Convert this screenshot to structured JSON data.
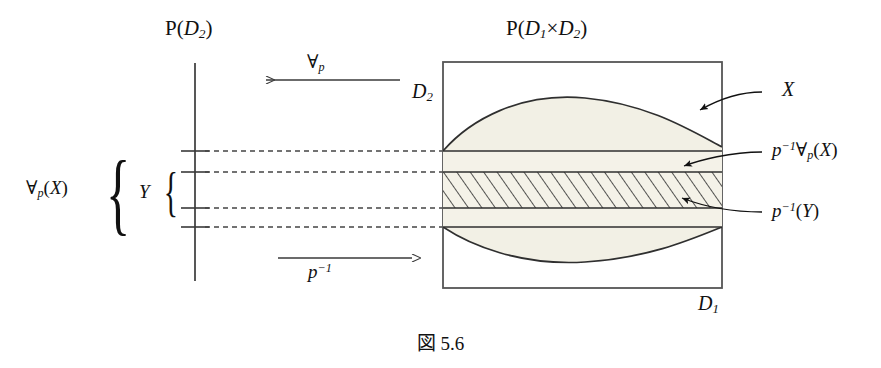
{
  "figure": {
    "caption": "図 5.6",
    "left_panel": {
      "title_prefix": "P",
      "title_open": "(",
      "title_base": "D",
      "title_sub": "2",
      "title_close": ")"
    },
    "right_panel": {
      "title_prefix": "P",
      "title_open": "(",
      "title_base1": "D",
      "title_sub1": "1",
      "title_times": "×",
      "title_base2": "D",
      "title_sub2": "2",
      "title_close": ")"
    },
    "axis_labels": {
      "vertical": "D",
      "vertical_sub": "2",
      "horizontal": "D",
      "horizontal_sub": "1"
    },
    "arrows": {
      "top": {
        "label_symbol": "∀",
        "label_sub": "p",
        "direction": "left"
      },
      "bottom": {
        "label_base": "p",
        "label_sup": "−1",
        "direction": "right"
      }
    },
    "left_labels": [
      {
        "name": "forall-p-X",
        "symbol": "∀",
        "sub": "p",
        "open": "(",
        "arg": "X",
        "close": ")"
      },
      {
        "name": "Y",
        "text": "Y"
      }
    ],
    "right_labels": [
      {
        "name": "X",
        "parts": [
          {
            "text": "X",
            "style": "italic"
          }
        ]
      },
      {
        "name": "p-inverse-forall-p-X",
        "parts": [
          {
            "text": "p",
            "style": "italic"
          },
          {
            "text": "−1",
            "style": "sup"
          },
          {
            "text": "∀",
            "style": "upright"
          },
          {
            "text": "p",
            "style": "sub"
          },
          {
            "text": "(",
            "style": "upright"
          },
          {
            "text": "X",
            "style": "italic"
          },
          {
            "text": ")",
            "style": "upright"
          }
        ]
      },
      {
        "name": "p-inverse-Y",
        "parts": [
          {
            "text": "p",
            "style": "italic"
          },
          {
            "text": "−1",
            "style": "sup"
          },
          {
            "text": "(",
            "style": "upright"
          },
          {
            "text": "Y",
            "style": "italic"
          },
          {
            "text": ")",
            "style": "upright"
          }
        ]
      }
    ],
    "colors": {
      "ink": "#111111",
      "line": "#3a3a3a",
      "fill_cream": "#f2f0e5",
      "fill_band": "#f4f2e8",
      "hatch": "#2a2a2a",
      "dash": "#444444",
      "box_border": "#555555"
    },
    "geometry_note": {
      "box_left": 443,
      "box_top": 62,
      "box_right": 722,
      "box_bottom": 288,
      "axis_x": 195,
      "axis_top": 63,
      "axis_bottom": 281,
      "tick_y": [
        151,
        172,
        208,
        227
      ]
    }
  }
}
